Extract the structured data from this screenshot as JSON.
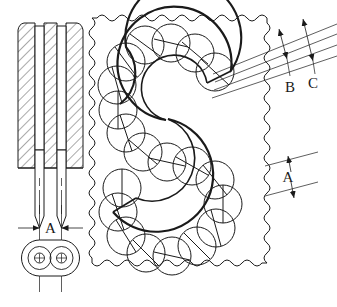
{
  "drawing": {
    "title": "Sectional tooling and S-shaped bead pattern detail",
    "background_color": "#ffffff",
    "line_color": "#1a1a1a",
    "hatch_color": "#555555",
    "views": {
      "left_section": {
        "name": "needle-assembly-section-view",
        "description": "Hatched sectional view of a two-pin needle assembly with pointed tips",
        "hatch_style": "diagonal-45",
        "pin_count": 2
      },
      "bottom_detail": {
        "name": "obround-footprint-detail",
        "description": "Plan view obround outline enclosing two concentric bore circles with centre crosses",
        "bore_count": 2
      },
      "right_panel": {
        "name": "s-pattern-panel-view",
        "description": "Broken-out panel with wavy break-line border containing an S-shaped band of overlapping circles",
        "border_style": "wavy-break-line",
        "circle_count": 18,
        "circle_marking": "diametral-slash"
      }
    },
    "dimensions": [
      {
        "id": "dim-a-bottom",
        "label": "A",
        "location": "bottom-left-detail",
        "arrow_style": "inward-pointing",
        "orientation": "horizontal"
      },
      {
        "id": "dim-a-right",
        "label": "A",
        "location": "right-of-panel",
        "arrow_style": "outward-pointing",
        "orientation": "slanted"
      },
      {
        "id": "dim-b",
        "label": "B",
        "location": "upper-right",
        "arrow_style": "outward-pointing",
        "orientation": "slanted"
      },
      {
        "id": "dim-c",
        "label": "C",
        "location": "upper-right",
        "arrow_style": "outward-pointing",
        "orientation": "slanted"
      }
    ],
    "labels": {
      "a_bottom": "A",
      "a_right": "A",
      "b": "B",
      "c": "C"
    }
  }
}
